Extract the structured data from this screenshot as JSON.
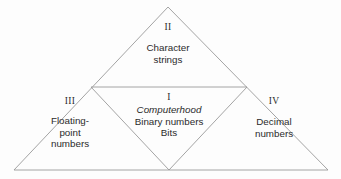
{
  "diagram": {
    "background_color": "#fdfdfd",
    "line_color": "#9a9a9a",
    "text_color": "#2b2b2b",
    "regions": [
      {
        "numeral": "II",
        "position": "top",
        "lines": [
          "Character",
          "strings"
        ]
      },
      {
        "numeral": "III",
        "position": "left",
        "lines": [
          "Floating-",
          "point",
          "numbers"
        ]
      },
      {
        "numeral": "I",
        "position": "center",
        "emphasis": "Computerhood",
        "lines": [
          "Binary numbers",
          "Bits"
        ]
      },
      {
        "numeral": "IV",
        "position": "right",
        "lines": [
          "Decimal",
          "numbers"
        ]
      }
    ]
  }
}
